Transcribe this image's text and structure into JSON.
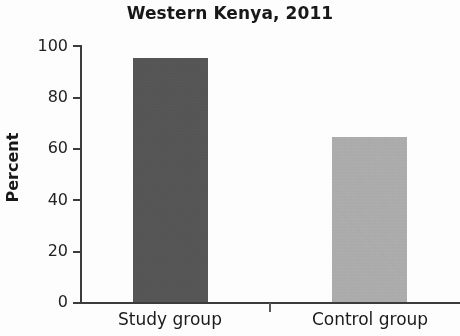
{
  "chart_data": {
    "type": "bar",
    "title": "Western Kenya, 2011",
    "xlabel": "",
    "ylabel": "Percent",
    "categories": [
      "Study group",
      "Control group"
    ],
    "values": [
      95,
      64.5
    ],
    "series": [
      {
        "name": "Percent",
        "values": [
          95,
          64.5
        ]
      }
    ],
    "ylim": [
      0,
      100
    ],
    "yticks": [
      0,
      20,
      40,
      60,
      80,
      100
    ],
    "ytick_labels": [
      "0",
      "20",
      "40",
      "60",
      "80",
      "100"
    ],
    "grid": false,
    "legend": "none",
    "bar_colors": [
      "#5a5a5a",
      "#b5b5b5"
    ]
  },
  "bars": [
    {
      "label": "Study group",
      "value": 95,
      "color": "#5a5a5a"
    },
    {
      "label": "Control group",
      "value": 64.5,
      "color": "#b5b5b5"
    }
  ],
  "yticks": [
    {
      "label": "100",
      "value": 100
    },
    {
      "label": "80",
      "value": 80
    },
    {
      "label": "60",
      "value": 60
    },
    {
      "label": "40",
      "value": 40
    },
    {
      "label": "20",
      "value": 20
    },
    {
      "label": "0",
      "value": 0
    }
  ]
}
